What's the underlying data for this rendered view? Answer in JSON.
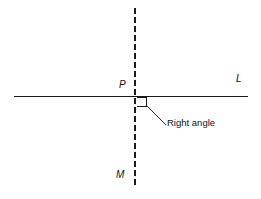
{
  "figure": {
    "kind": "geometry-diagram",
    "width": 261,
    "height": 199,
    "background_color": "#ffffff",
    "stroke_color": "#1a1a1a",
    "text_color": "#111111"
  },
  "labels": {
    "point": "P",
    "line_horizontal": "L",
    "line_vertical": "M",
    "annotation": "Right angle"
  },
  "geometry": {
    "line_L": {
      "name": "horizontal-solid-line",
      "style": "solid",
      "x1": 14,
      "y1": 96,
      "x2": 248,
      "y2": 96,
      "stroke_width": 1
    },
    "line_M": {
      "name": "vertical-dashed-line",
      "style": "dashed",
      "x1": 135,
      "y1": 8,
      "x2": 135,
      "y2": 186,
      "stroke_width": 1.4,
      "dash": "6 3"
    },
    "right_angle_marker": {
      "name": "right-angle-square",
      "points": "137,97 146,97 146,106 137,106",
      "stroke_width": 1
    },
    "leader_line": {
      "name": "annotation-leader-line",
      "x1": 147,
      "y1": 106,
      "x2": 166,
      "y2": 125,
      "stroke_width": 0.9
    },
    "intersection_point": {
      "name": "point-P",
      "x": 135,
      "y": 96
    }
  }
}
